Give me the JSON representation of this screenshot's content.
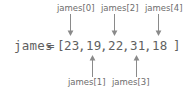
{
  "diagram": {
    "colors": {
      "text": "#6d6d6d",
      "code": "#5f5f5f",
      "arrow": "#8a8a8a",
      "background": "#ffffff"
    },
    "code": {
      "variable": "james",
      "operator": "=",
      "bracket_open": "[",
      "bracket_close": "]",
      "separator": ",",
      "values": [
        "23",
        "19",
        "22",
        "31",
        "18"
      ]
    },
    "labels_top": [
      {
        "text": "james[0]",
        "index": 0
      },
      {
        "text": "james[2]",
        "index": 2
      },
      {
        "text": "james[4]",
        "index": 4
      }
    ],
    "labels_bottom": [
      {
        "text": "james[1]",
        "index": 1
      },
      {
        "text": "james[3]",
        "index": 3
      }
    ]
  }
}
